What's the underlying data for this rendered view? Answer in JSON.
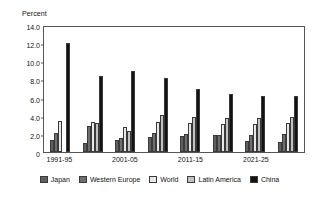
{
  "chart_data": {
    "type": "bar",
    "title": "",
    "subtitle": "",
    "xlabel": "",
    "ylabel": "Percent",
    "ylim": [
      0,
      14.0
    ],
    "ytick_labels": [
      "14.0",
      "12.0",
      "10.0",
      "8.0",
      "6.0",
      "4.0",
      "2.0",
      "0"
    ],
    "ytick_values": [
      14.0,
      12.0,
      10.0,
      8.0,
      6.0,
      4.0,
      2.0,
      0
    ],
    "grid": false,
    "legend_position": "bottom",
    "categories": [
      "1991-95",
      "",
      "2001-05",
      "",
      "2011-15",
      "",
      "2021-25",
      ""
    ],
    "tick_labels_visible": [
      "1991-95",
      "2001-05",
      "2011-15",
      "2021-25"
    ],
    "series": [
      {
        "name": "Japan",
        "color": "#5f5f5f",
        "values": [
          1.3,
          1.0,
          1.35,
          1.7,
          1.8,
          1.85,
          1.2,
          1.05
        ]
      },
      {
        "name": "Western Europe",
        "color": "#6f6f6f",
        "values": [
          2.1,
          2.85,
          1.55,
          2.05,
          1.95,
          1.9,
          1.9,
          1.95
        ]
      },
      {
        "name": "World",
        "color": "#e8e8e8",
        "values": [
          3.4,
          3.3,
          2.75,
          3.35,
          3.15,
          3.05,
          3.1,
          3.15
        ]
      },
      {
        "name": "Latin America",
        "color": "#c2c2c2",
        "values": [
          0.0,
          3.15,
          2.3,
          4.1,
          3.85,
          3.75,
          3.8,
          3.85
        ]
      },
      {
        "name": "China",
        "color": "#121212",
        "values": [
          12.0,
          8.35,
          8.9,
          8.15,
          6.95,
          6.4,
          6.15,
          6.15
        ]
      }
    ]
  },
  "legend": {
    "items": [
      {
        "label": "Japan",
        "color": "#5f5f5f"
      },
      {
        "label": "Western Europe",
        "color": "#6f6f6f"
      },
      {
        "label": "World",
        "color": "#e8e8e8"
      },
      {
        "label": "Latin America",
        "color": "#c2c2c2"
      },
      {
        "label": "China",
        "color": "#121212"
      }
    ]
  }
}
